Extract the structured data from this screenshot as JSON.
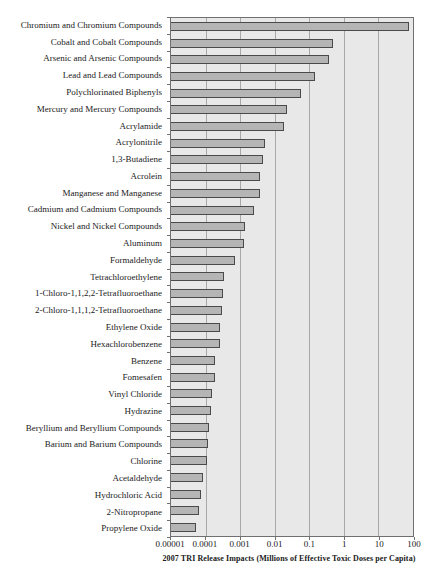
{
  "chart_data": {
    "type": "bar",
    "orientation": "horizontal",
    "x_scale": "log",
    "xlim": [
      1e-05,
      100
    ],
    "x_ticks": [
      "0.00001",
      "0.0001",
      "0.001",
      "0.01",
      "0.1",
      "1",
      "10",
      "100"
    ],
    "xlabel": "2007 TRI Release Impacts (Millions of Effective Toxic Doses per Capita)",
    "ylabel": "",
    "title": "",
    "legend": "none",
    "grid": "vertical decade gridlines on",
    "categories": [
      "Chromium and Chromium Compounds",
      "Cobalt and Cobalt Compounds",
      "Arsenic and Arsenic Compounds",
      "Lead and Lead Compounds",
      "Polychlorinated Biphenyls",
      "Mercury and Mercury Compounds",
      "Acrylamide",
      "Acrylonitrile",
      "1,3-Butadiene",
      "Acrolein",
      "Manganese and Manganese",
      "Cadmium and Cadmium Compounds",
      "Nickel and Nickel Compounds",
      "Aluminum",
      "Formaldehyde",
      "Tetrachloroethylene",
      "1-Chloro-1,1,2,2-Tetrafluoroethane",
      "2-Chloro-1,1,1,2-Tetrafluoroethane",
      "Ethylene Oxide",
      "Hexachlorobenzene",
      "Benzene",
      "Fomesafen",
      "Vinyl Chloride",
      "Hydrazine",
      "Beryllium and Beryllium Compounds",
      "Barium and Barium Compounds",
      "Chlorine",
      "Acetaldehyde",
      "Hydrochloric Acid",
      "2-Nitropropane",
      "Propylene Oxide"
    ],
    "values": [
      70,
      0.45,
      0.35,
      0.14,
      0.055,
      0.021,
      0.017,
      0.005,
      0.0042,
      0.0035,
      0.0034,
      0.0023,
      0.0013,
      0.0012,
      0.00065,
      0.00033,
      0.00029,
      0.00028,
      0.00025,
      0.00024,
      0.00018,
      0.00017,
      0.00014,
      0.00013,
      0.00012,
      0.00011,
      0.0001,
      8e-05,
      7e-05,
      6e-05,
      5e-05
    ],
    "colors": {
      "plot_background": "#e8e8e8",
      "bar_fill": "#b5b5b5",
      "bar_border": "#4a4a4a",
      "gridline": "#a8a8a8",
      "frame": "#707070",
      "text": "#1a1a1a"
    }
  }
}
